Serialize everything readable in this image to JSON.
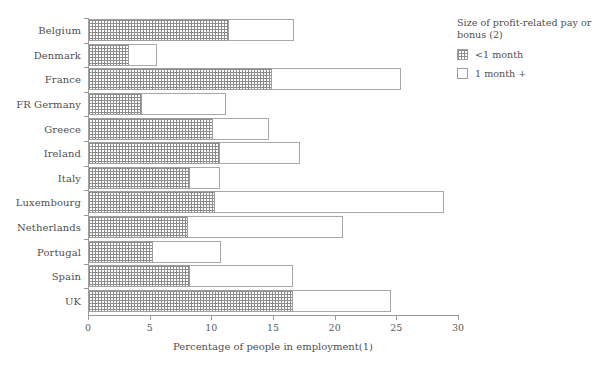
{
  "chart_data": {
    "type": "bar",
    "orientation": "horizontal",
    "stacked": true,
    "title": "",
    "xlabel": "Percentage of  people in employment(1)",
    "ylabel": "",
    "xlim": [
      0,
      30
    ],
    "xticks": [
      0,
      5,
      10,
      15,
      20,
      25,
      30
    ],
    "grid": false,
    "legend_position": "right",
    "legend_title": "Size of profit-related pay or bonus (2)",
    "categories": [
      "Belgium",
      "Denmark",
      "France",
      "FR Germany",
      "Greece",
      "Ireland",
      "Italy",
      "Luxembourg",
      "Netherlands",
      "Portugal",
      "Spain",
      "UK"
    ],
    "series": [
      {
        "name": "<1 month",
        "values": [
          11.4,
          3.3,
          14.9,
          4.4,
          10.1,
          10.7,
          8.3,
          10.3,
          8.1,
          5.3,
          8.3,
          16.6
        ]
      },
      {
        "name": "1 month +",
        "values": [
          5.3,
          2.3,
          10.5,
          6.8,
          4.6,
          6.5,
          2.4,
          18.6,
          12.6,
          5.5,
          8.3,
          8.0
        ]
      }
    ],
    "totals": [
      16.7,
      5.6,
      25.4,
      11.2,
      14.7,
      17.2,
      10.7,
      28.9,
      20.7,
      10.8,
      16.6,
      24.6
    ]
  },
  "legend": {
    "title": "Size of profit-related pay or bonus (2)",
    "items": [
      {
        "label": "<1 month",
        "pattern": "hatched"
      },
      {
        "label": "1 month +",
        "pattern": "empty"
      }
    ]
  },
  "axis": {
    "x_title": "Percentage of  people in employment(1)",
    "x_tick_labels": [
      "0",
      "5",
      "10",
      "15",
      "20",
      "25",
      "30"
    ]
  }
}
